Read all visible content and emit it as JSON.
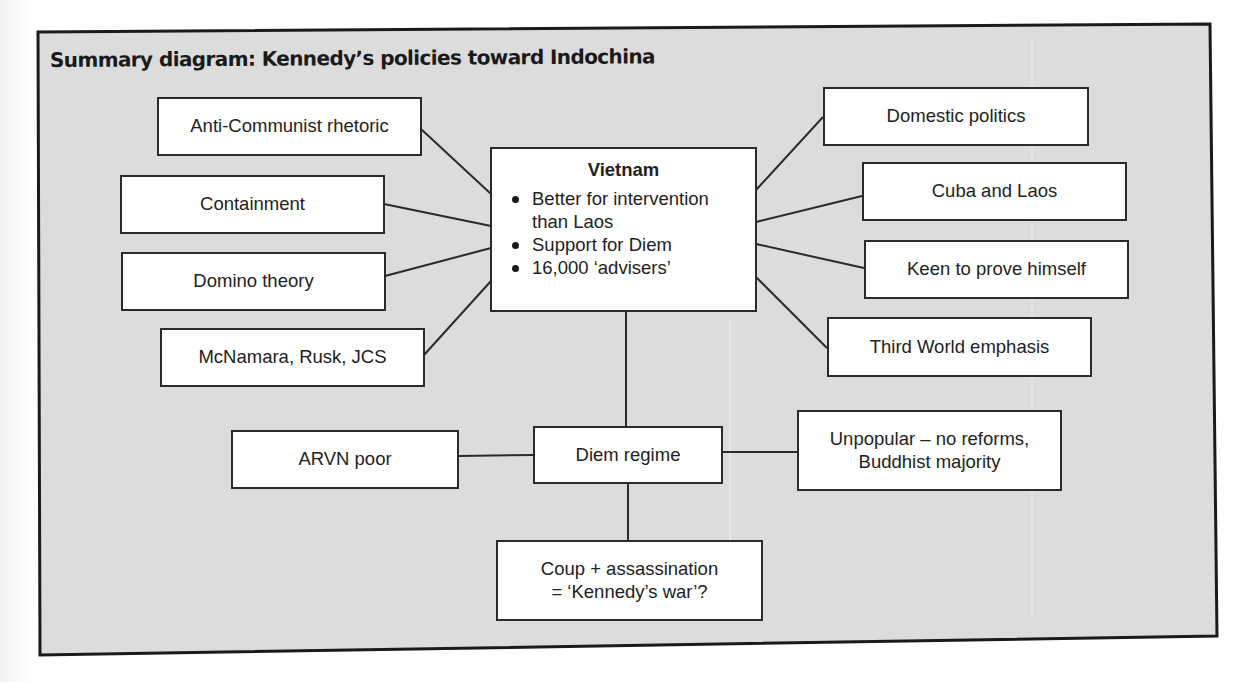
{
  "title": "Summary diagram: Kennedy’s policies toward Indochina",
  "colors": {
    "panel_background": "#dcdcdc",
    "box_background": "#ffffff",
    "border": "#1a1a1a",
    "text": "#222222"
  },
  "center": {
    "heading": "Vietnam",
    "bullets": [
      "Better for intervention than Laos",
      "Support for Diem",
      "16,000 ‘advisers’"
    ]
  },
  "left_factors": [
    "Anti-Communist rhetoric",
    "Containment",
    "Domino theory",
    "McNamara, Rusk, JCS"
  ],
  "right_factors": [
    "Domestic politics",
    "Cuba and Laos",
    "Keen to prove himself",
    "Third World emphasis"
  ],
  "diem": {
    "label": "Diem regime",
    "left": "ARVN poor",
    "right_line1": "Unpopular – no reforms,",
    "right_line2": "Buddhist majority",
    "outcome_line1": "Coup + assassination",
    "outcome_line2": "= ‘Kennedy’s war’?"
  }
}
